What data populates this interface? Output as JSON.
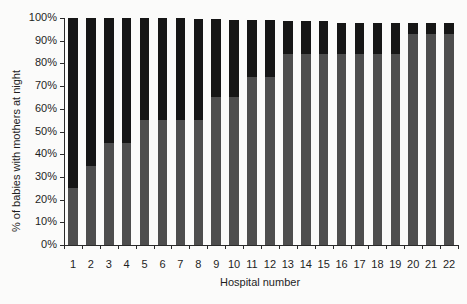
{
  "chart_data": {
    "type": "bar",
    "stacked": true,
    "title": "",
    "xlabel": "Hospital number",
    "ylabel": "% of babies with mothers at night",
    "ylim": [
      0,
      100
    ],
    "yticks": [
      "0%",
      "10%",
      "20%",
      "30%",
      "40%",
      "50%",
      "60%",
      "70%",
      "80%",
      "90%",
      "100%"
    ],
    "categories": [
      "1",
      "2",
      "3",
      "4",
      "5",
      "6",
      "7",
      "8",
      "9",
      "10",
      "11",
      "12",
      "13",
      "14",
      "15",
      "16",
      "17",
      "18",
      "19",
      "20",
      "21",
      "22"
    ],
    "series": [
      {
        "name": "lower segment (grey)",
        "color": "#4e4e4e",
        "values": [
          25,
          35,
          45,
          45,
          55,
          55,
          55,
          55,
          65,
          65,
          74,
          74,
          84,
          84,
          84,
          84,
          84,
          84,
          84,
          93,
          93,
          93
        ]
      },
      {
        "name": "upper segment (black)",
        "color": "#161616",
        "values": [
          75,
          65,
          55,
          55,
          45,
          45,
          45,
          44.5,
          34.5,
          34,
          25,
          25,
          14.5,
          14.5,
          14.5,
          14,
          14,
          14,
          14,
          5,
          5,
          5
        ]
      }
    ],
    "totals": [
      100,
      100,
      100,
      100,
      100,
      100,
      100,
      99.5,
      99.5,
      99,
      99,
      99,
      98.5,
      98.5,
      98.5,
      98,
      98,
      98,
      98,
      98,
      98,
      98
    ],
    "grid": false,
    "legend": "none"
  }
}
